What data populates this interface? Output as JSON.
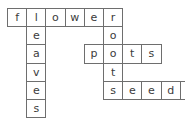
{
  "puzzle": {
    "type": "crossword",
    "theme": "plant-parts",
    "grid": {
      "columns": 10,
      "rows": 6,
      "cell_width": 19.2,
      "cell_height": 18.2,
      "origin_x": 7,
      "origin_y": 8,
      "border_color": "#6e6e6e",
      "cell_background": "#ffffff",
      "letter_color": "#3b3b3b",
      "page_background": "#ffffff"
    },
    "words": [
      {
        "id": "flower",
        "text": "flower",
        "direction": "across",
        "row": 0,
        "col": 0,
        "length": 6,
        "letters": [
          "f",
          "l",
          "o",
          "w",
          "e",
          "r"
        ]
      },
      {
        "id": "leaves",
        "text": "leaves",
        "direction": "down",
        "row": 0,
        "col": 1,
        "length": 6,
        "letters": [
          "l",
          "e",
          "a",
          "v",
          "e",
          "s"
        ]
      },
      {
        "id": "roots",
        "text": "roots",
        "direction": "down",
        "row": 0,
        "col": 5,
        "length": 5,
        "letters": [
          "r",
          "o",
          "o",
          "t",
          "s"
        ]
      },
      {
        "id": "pots",
        "text": "pots",
        "direction": "across",
        "row": 2,
        "col": 4,
        "length": 4,
        "letters": [
          "p",
          "o",
          "t",
          "s"
        ]
      },
      {
        "id": "seeds",
        "text": "seeds",
        "direction": "across",
        "row": 4,
        "col": 5,
        "length": 5,
        "letters": [
          "s",
          "e",
          "e",
          "d",
          "s"
        ]
      }
    ],
    "cells": [
      {
        "name": "cell-r0c0",
        "letter": "f",
        "row": 0,
        "col": 0
      },
      {
        "name": "cell-r0c1",
        "letter": "l",
        "row": 0,
        "col": 1
      },
      {
        "name": "cell-r0c2",
        "letter": "o",
        "row": 0,
        "col": 2
      },
      {
        "name": "cell-r0c3",
        "letter": "w",
        "row": 0,
        "col": 3
      },
      {
        "name": "cell-r0c4",
        "letter": "e",
        "row": 0,
        "col": 4
      },
      {
        "name": "cell-r0c5",
        "letter": "r",
        "row": 0,
        "col": 5
      },
      {
        "name": "cell-r1c1",
        "letter": "e",
        "row": 1,
        "col": 1
      },
      {
        "name": "cell-r1c5",
        "letter": "o",
        "row": 1,
        "col": 5
      },
      {
        "name": "cell-r2c1",
        "letter": "a",
        "row": 2,
        "col": 1
      },
      {
        "name": "cell-r2c4",
        "letter": "p",
        "row": 2,
        "col": 4
      },
      {
        "name": "cell-r2c5",
        "letter": "o",
        "row": 2,
        "col": 5
      },
      {
        "name": "cell-r2c6",
        "letter": "t",
        "row": 2,
        "col": 6
      },
      {
        "name": "cell-r2c7",
        "letter": "s",
        "row": 2,
        "col": 7
      },
      {
        "name": "cell-r3c1",
        "letter": "v",
        "row": 3,
        "col": 1
      },
      {
        "name": "cell-r3c5",
        "letter": "t",
        "row": 3,
        "col": 5
      },
      {
        "name": "cell-r4c1",
        "letter": "e",
        "row": 4,
        "col": 1
      },
      {
        "name": "cell-r4c5",
        "letter": "s",
        "row": 4,
        "col": 5
      },
      {
        "name": "cell-r4c6",
        "letter": "e",
        "row": 4,
        "col": 6
      },
      {
        "name": "cell-r4c7",
        "letter": "e",
        "row": 4,
        "col": 7
      },
      {
        "name": "cell-r4c8",
        "letter": "d",
        "row": 4,
        "col": 8
      },
      {
        "name": "cell-r4c9",
        "letter": "s",
        "row": 4,
        "col": 9
      },
      {
        "name": "cell-r5c1",
        "letter": "s",
        "row": 5,
        "col": 1
      }
    ]
  }
}
